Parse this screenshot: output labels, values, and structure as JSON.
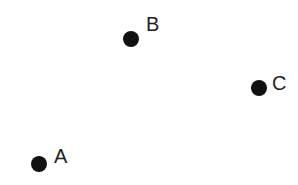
{
  "diagram": {
    "background": "#ffffff",
    "dot_color": "#111111",
    "label_color": "#222222",
    "points": [
      {
        "label": "A",
        "x": 39,
        "y": 164,
        "label_dx": 15,
        "label_dy": -18
      },
      {
        "label": "B",
        "x": 131,
        "y": 39,
        "label_dx": 15,
        "label_dy": -25
      },
      {
        "label": "C",
        "x": 259,
        "y": 88,
        "label_dx": 13,
        "label_dy": -15
      }
    ]
  }
}
